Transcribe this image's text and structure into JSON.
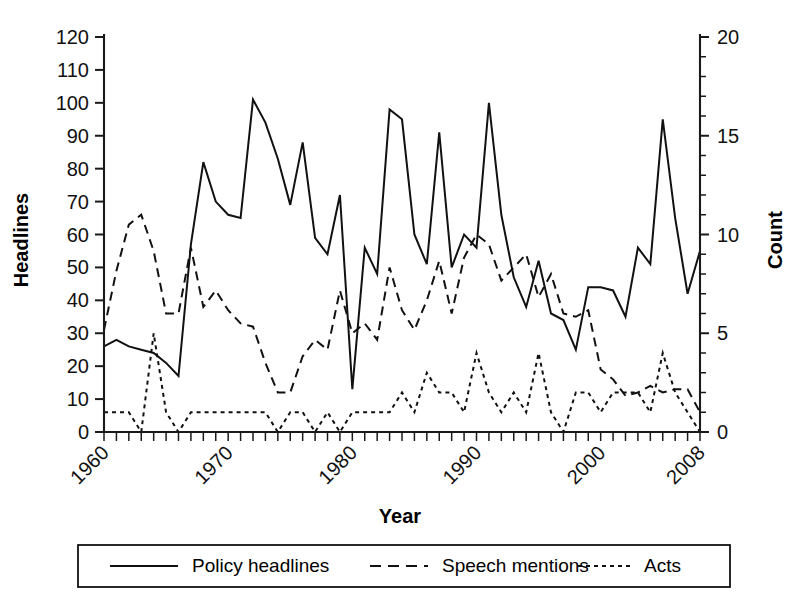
{
  "chart_data": {
    "type": "line",
    "title": "",
    "xlabel": "Year",
    "ylabel": "Headlines",
    "y2label": "Count",
    "xlim": [
      1960,
      2008
    ],
    "ylim": [
      0,
      120
    ],
    "y2lim": [
      0,
      20
    ],
    "grid": false,
    "legend_position": "bottom",
    "x_tick_labels": [
      "1960",
      "1970",
      "1980",
      "1990",
      "2000",
      "2008"
    ],
    "x_tick_values": [
      1960,
      1970,
      1980,
      1990,
      2000,
      2008
    ],
    "x_minor_step": 1,
    "y_tick_labels": [
      "0",
      "10",
      "20",
      "30",
      "40",
      "50",
      "60",
      "70",
      "80",
      "90",
      "100",
      "110",
      "120"
    ],
    "y_tick_values": [
      0,
      10,
      20,
      30,
      40,
      50,
      60,
      70,
      80,
      90,
      100,
      110,
      120
    ],
    "y2_tick_labels": [
      "0",
      "5",
      "10",
      "15",
      "20"
    ],
    "y2_tick_values": [
      0,
      5,
      10,
      15,
      20
    ],
    "y2_minor_step": 1,
    "x": [
      1960,
      1961,
      1962,
      1963,
      1964,
      1965,
      1966,
      1967,
      1968,
      1969,
      1970,
      1971,
      1972,
      1973,
      1974,
      1975,
      1976,
      1977,
      1978,
      1979,
      1980,
      1981,
      1982,
      1983,
      1984,
      1985,
      1986,
      1987,
      1988,
      1989,
      1990,
      1991,
      1992,
      1993,
      1994,
      1995,
      1996,
      1997,
      1998,
      1999,
      2000,
      2001,
      2002,
      2003,
      2004,
      2005,
      2006,
      2007,
      2008
    ],
    "series": [
      {
        "name": "Policy headlines",
        "axis": "left",
        "style": "solid",
        "values": [
          26,
          28,
          26,
          25,
          24,
          21,
          17,
          57,
          82,
          70,
          66,
          65,
          101,
          94,
          83,
          69,
          88,
          59,
          54,
          72,
          13,
          56,
          48,
          98,
          95,
          60,
          51,
          91,
          50,
          60,
          56,
          100,
          66,
          47,
          38,
          52,
          36,
          34,
          25,
          44,
          44,
          43,
          35,
          56,
          51,
          95,
          65,
          42,
          55
        ]
      },
      {
        "name": "Speech mentions",
        "axis": "left",
        "style": "dashed",
        "values": [
          31,
          49,
          63,
          66,
          55,
          36,
          36,
          56,
          38,
          43,
          37,
          33,
          32,
          21,
          12,
          12,
          23,
          28,
          25,
          43,
          30,
          33,
          28,
          50,
          37,
          31,
          40,
          52,
          36,
          53,
          60,
          57,
          46,
          50,
          54,
          41,
          48,
          36,
          35,
          37,
          19,
          16,
          11,
          12,
          14,
          12,
          13,
          13,
          6
        ]
      },
      {
        "name": "Acts",
        "axis": "right",
        "style": "dotted",
        "values": [
          1,
          1,
          1,
          0,
          5,
          1,
          0,
          1,
          1,
          1,
          1,
          1,
          1,
          1,
          0,
          1,
          1,
          0,
          1,
          0,
          1,
          1,
          1,
          1,
          2,
          1,
          3,
          2,
          2,
          1,
          4,
          2,
          1,
          2,
          1,
          4,
          1,
          0,
          2,
          2,
          1,
          2,
          2,
          2,
          1,
          4,
          2,
          1,
          0
        ]
      }
    ]
  },
  "legend": {
    "items": [
      {
        "label": "Policy headlines",
        "style": "solid"
      },
      {
        "label": "Speech mentions",
        "style": "dashed"
      },
      {
        "label": "Acts",
        "style": "dotted"
      }
    ]
  }
}
